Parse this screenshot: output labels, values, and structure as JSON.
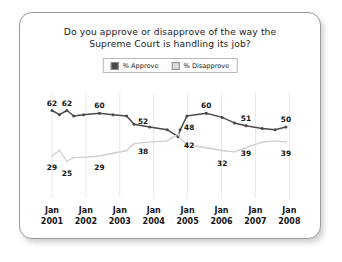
{
  "chart_data": {
    "type": "line",
    "title": "Do you approve or disapprove of the way the Supreme Court is handling its job?",
    "title_line1": "Do you approve or disapprove of the way the",
    "title_line2": "Supreme Court is handling its job?",
    "xlabel": "",
    "ylabel": "",
    "ylim": [
      0,
      75
    ],
    "grid": "vertical",
    "legend_position": "top-center",
    "categories": [
      "Jan 2001",
      "Jan 2002",
      "Jan 2003",
      "Jan 2004",
      "Jan 2005",
      "Jan 2006",
      "Jan 2007",
      "Jan 2008"
    ],
    "tick_labels": [
      {
        "line1": "Jan",
        "line2": "2001"
      },
      {
        "line1": "Jan",
        "line2": "2002"
      },
      {
        "line1": "Jan",
        "line2": "2003"
      },
      {
        "line1": "Jan",
        "line2": "2004"
      },
      {
        "line1": "Jan",
        "line2": "2005"
      },
      {
        "line1": "Jan",
        "line2": "2006"
      },
      {
        "line1": "Jan",
        "line2": "2007"
      },
      {
        "line1": "Jan",
        "line2": "2008"
      }
    ],
    "series": [
      {
        "name": "% Approve",
        "color": "#4a4a4a",
        "values": [
          62,
          59,
          62,
          58,
          59,
          60,
          59,
          58,
          52,
          50,
          48,
          43,
          48,
          58,
          60,
          57,
          53,
          51,
          49,
          48,
          50
        ],
        "x": [
          0.0,
          0.22,
          0.44,
          0.64,
          0.93,
          1.4,
          1.8,
          2.2,
          2.42,
          2.88,
          3.4,
          3.72,
          3.78,
          3.98,
          4.55,
          5.02,
          5.38,
          5.72,
          6.2,
          6.58,
          6.9
        ],
        "labels": [
          {
            "value": 62,
            "x": 0.0,
            "y": 62
          },
          {
            "value": 62,
            "x": 0.44,
            "y": 62
          },
          {
            "value": 60,
            "x": 1.4,
            "y": 60
          },
          {
            "value": 52,
            "x": 2.42,
            "y": 52
          },
          {
            "value": 48,
            "x": 3.78,
            "y": 48
          },
          {
            "value": 60,
            "x": 4.55,
            "y": 60
          },
          {
            "value": 51,
            "x": 5.72,
            "y": 51
          },
          {
            "value": 50,
            "x": 6.9,
            "y": 50
          }
        ]
      },
      {
        "name": "% Disapprove",
        "color": "#cdcdcd",
        "values": [
          29,
          33,
          25,
          28,
          28,
          29,
          31,
          33,
          38,
          39,
          40,
          45,
          42,
          37,
          35,
          33,
          32,
          35,
          39,
          40,
          39
        ],
        "x": [
          0.0,
          0.22,
          0.44,
          0.64,
          0.93,
          1.4,
          1.8,
          2.2,
          2.42,
          2.88,
          3.4,
          3.72,
          3.78,
          3.98,
          4.55,
          5.02,
          5.38,
          5.72,
          6.2,
          6.58,
          6.9
        ],
        "labels": [
          {
            "value": 29,
            "x": 0.0,
            "y": 29
          },
          {
            "value": 25,
            "x": 0.44,
            "y": 25
          },
          {
            "value": 29,
            "x": 1.4,
            "y": 29
          },
          {
            "value": 38,
            "x": 2.42,
            "y": 38
          },
          {
            "value": 42,
            "x": 3.78,
            "y": 42
          },
          {
            "value": 32,
            "x": 5.02,
            "y": 32
          },
          {
            "value": 39,
            "x": 5.72,
            "y": 39
          },
          {
            "value": 39,
            "x": 6.9,
            "y": 39
          }
        ]
      }
    ]
  },
  "legend": {
    "items": [
      {
        "label": "% Approve",
        "color": "#4a4a4a"
      },
      {
        "label": "% Disapprove",
        "color": "#d9d9d9"
      }
    ]
  },
  "colors": {
    "approve": "#4a4a4a",
    "disapprove": "#cdcdcd",
    "gridline": "#e8e8e8",
    "axis": "#d9d9d9",
    "border": "#9a9a9a"
  }
}
